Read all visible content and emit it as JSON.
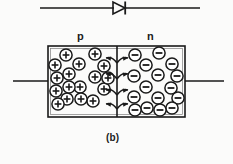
{
  "figure": {
    "caption": "(b)",
    "title_symbol": "diode-symbol",
    "region_labels": {
      "p": "p",
      "n": "n"
    },
    "colors": {
      "ink": "#1a1a1a",
      "background": "#fbfbfa",
      "charge_fill": "#ffffff"
    }
  },
  "diode_symbol": {
    "name": "diode-symbol",
    "lead_left_x": 40,
    "lead_right_x": 200,
    "axis_y": 8,
    "triangle": {
      "x1": 113,
      "x2": 125,
      "half_height": 6
    },
    "cathode_bar_x": 125
  },
  "junction_box": {
    "x": 48,
    "y": 46,
    "width": 137,
    "height": 71,
    "junction_x": 117,
    "lead_y": 81,
    "lead_left_start": 13,
    "lead_right_end": 224
  },
  "p_region": {
    "label": "p",
    "charge_sign": "+",
    "charge_name": "positive-charge",
    "count": 17,
    "charges": [
      {
        "cx": 66,
        "cy": 55
      },
      {
        "cx": 95,
        "cy": 54
      },
      {
        "cx": 55,
        "cy": 65
      },
      {
        "cx": 79,
        "cy": 64
      },
      {
        "cx": 104,
        "cy": 66
      },
      {
        "cx": 57,
        "cy": 78
      },
      {
        "cx": 69,
        "cy": 74
      },
      {
        "cx": 95,
        "cy": 77
      },
      {
        "cx": 56,
        "cy": 91
      },
      {
        "cx": 80,
        "cy": 87
      },
      {
        "cx": 104,
        "cy": 89
      },
      {
        "cx": 67,
        "cy": 99
      },
      {
        "cx": 93,
        "cy": 101
      },
      {
        "cx": 108,
        "cy": 78
      },
      {
        "cx": 69,
        "cy": 87
      },
      {
        "cx": 81,
        "cy": 99
      },
      {
        "cx": 58,
        "cy": 104
      }
    ]
  },
  "n_region": {
    "label": "n",
    "charge_sign": "−",
    "charge_name": "negative-charge",
    "count": 16,
    "charges": [
      {
        "cx": 135,
        "cy": 55
      },
      {
        "cx": 159,
        "cy": 53
      },
      {
        "cx": 146,
        "cy": 65
      },
      {
        "cx": 172,
        "cy": 64
      },
      {
        "cx": 134,
        "cy": 76
      },
      {
        "cx": 158,
        "cy": 75
      },
      {
        "cx": 177,
        "cy": 76
      },
      {
        "cx": 146,
        "cy": 87
      },
      {
        "cx": 171,
        "cy": 88
      },
      {
        "cx": 134,
        "cy": 97
      },
      {
        "cx": 158,
        "cy": 98
      },
      {
        "cx": 178,
        "cy": 98
      },
      {
        "cx": 147,
        "cy": 108
      },
      {
        "cx": 135,
        "cy": 110
      },
      {
        "cx": 172,
        "cy": 108
      },
      {
        "cx": 160,
        "cy": 110
      }
    ]
  },
  "diffusion_arrows": {
    "name": "diffusion-arrow-pair",
    "count": 4,
    "rows_y": [
      57,
      73,
      89,
      103
    ],
    "span": 14
  }
}
